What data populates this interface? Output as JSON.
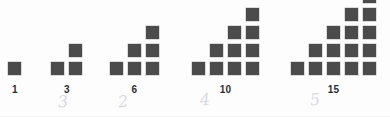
{
  "figure": {
    "square_color": "#4b4b4b",
    "background_color": "#fdfdfd",
    "label_color": "#2e2e2e",
    "pencil_color": "#d9d9dd",
    "cell_size": 13,
    "cell_gap": 5,
    "groups": [
      {
        "name": "group-1",
        "label": "1",
        "count": 1,
        "rows_bottom_up": [
          1
        ],
        "x": 8,
        "bottom_y": 62,
        "label_x": 8,
        "label_width": 14
      },
      {
        "name": "group-2",
        "label": "3",
        "count": 3,
        "rows_bottom_up": [
          2,
          1
        ],
        "x": 51,
        "bottom_y": 62,
        "label_x": 51,
        "label_width": 32
      },
      {
        "name": "group-3",
        "label": "6",
        "count": 6,
        "rows_bottom_up": [
          3,
          2,
          1
        ],
        "x": 110,
        "bottom_y": 62,
        "label_x": 110,
        "label_width": 49
      },
      {
        "name": "group-4",
        "label": "10",
        "count": 10,
        "rows_bottom_up": [
          4,
          3,
          2,
          1
        ],
        "x": 192,
        "bottom_y": 62,
        "label_x": 192,
        "label_width": 67
      },
      {
        "name": "group-5",
        "label": "15",
        "count": 15,
        "rows_bottom_up": [
          5,
          4,
          3,
          2,
          1
        ],
        "x": 291,
        "bottom_y": 62,
        "label_x": 291,
        "label_width": 85
      }
    ],
    "pencil_marks": [
      {
        "name": "pencil-mark-3",
        "text": "3",
        "x": 58,
        "y": 94
      },
      {
        "name": "pencil-mark-2",
        "text": "2",
        "x": 118,
        "y": 94
      },
      {
        "name": "pencil-mark-4",
        "text": "4",
        "x": 200,
        "y": 92
      },
      {
        "name": "pencil-mark-5",
        "text": "5",
        "x": 310,
        "y": 92
      }
    ]
  }
}
